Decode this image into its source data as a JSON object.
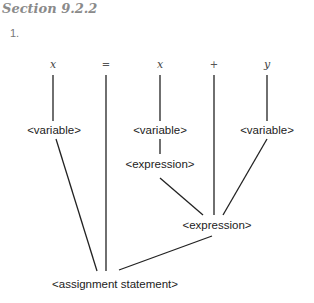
{
  "section": {
    "title": "Section 9.2.2",
    "item_number": "1."
  },
  "parse_tree": {
    "tokens": [
      {
        "text": "x",
        "x": 53
      },
      {
        "text": "=",
        "x": 106
      },
      {
        "text": "x",
        "x": 160
      },
      {
        "text": "+",
        "x": 214
      },
      {
        "text": "y",
        "x": 267
      }
    ],
    "nodes": {
      "variable_left": "<variable>",
      "variable_middle": "<variable>",
      "variable_right": "<variable>",
      "expression_upper": "<expression>",
      "expression_lower": "<expression>",
      "assignment_statement": "<assignment statement>"
    }
  }
}
